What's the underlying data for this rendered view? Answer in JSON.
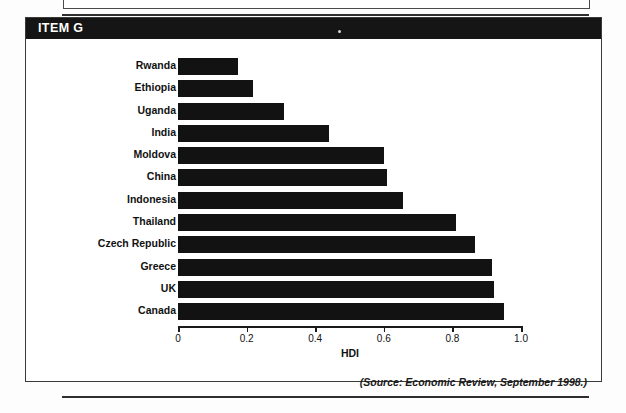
{
  "page": {
    "item_header_label": "ITEM G",
    "source_note": "(Source: Economic Review, September 1998.)"
  },
  "chart_data": {
    "type": "bar",
    "orientation": "horizontal",
    "title": "",
    "xlabel": "HDI",
    "ylabel": "",
    "xlim": [
      0,
      1.0
    ],
    "xticks": [
      "0",
      "0.2",
      "0.4",
      "0.6",
      "0.8",
      "1.0"
    ],
    "xtick_values": [
      0,
      0.2,
      0.4,
      0.6,
      0.8,
      1.0
    ],
    "grid": false,
    "legend": null,
    "bar_color": "#121212",
    "categories": [
      "Rwanda",
      "Ethiopia",
      "Uganda",
      "India",
      "Moldova",
      "China",
      "Indonesia",
      "Thailand",
      "Czech Republic",
      "Greece",
      "UK",
      "Canada"
    ],
    "values": [
      0.175,
      0.22,
      0.31,
      0.44,
      0.6,
      0.61,
      0.655,
      0.81,
      0.865,
      0.915,
      0.92,
      0.95
    ]
  }
}
